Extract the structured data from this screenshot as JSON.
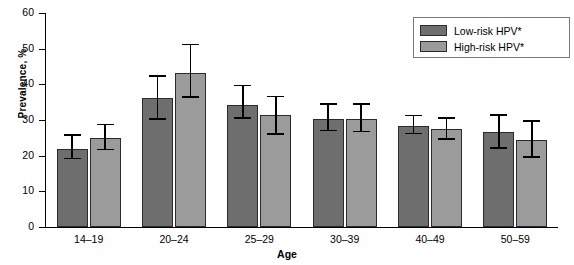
{
  "chart_data": {
    "type": "bar",
    "title": "",
    "xlabel": "Age",
    "ylabel": "Prevalence, %",
    "ylim": [
      0,
      60
    ],
    "yticks": [
      0,
      10,
      20,
      30,
      40,
      50,
      60
    ],
    "grid": false,
    "legend_position": "top-right",
    "categories": [
      "14–19",
      "20–24",
      "25–29",
      "30–39",
      "40–49",
      "50–59"
    ],
    "series": [
      {
        "name": "Low-risk HPV*",
        "color": "#6e6e6e",
        "values": [
          22.0,
          36.2,
          34.3,
          30.3,
          28.3,
          26.6
        ],
        "ci_low": [
          19.0,
          30.1,
          30.4,
          26.8,
          26.0,
          22.0
        ],
        "ci_high": [
          25.5,
          42.2,
          39.4,
          34.2,
          31.0,
          31.2
        ]
      },
      {
        "name": "High-risk HPV*",
        "color": "#9b9b9b",
        "values": [
          25.0,
          43.3,
          31.3,
          30.4,
          27.4,
          24.5
        ],
        "ci_low": [
          21.5,
          36.3,
          25.9,
          26.5,
          24.4,
          19.4
        ],
        "ci_high": [
          28.5,
          51.0,
          36.4,
          34.3,
          30.4,
          29.5
        ]
      }
    ]
  },
  "legend": {
    "items": [
      {
        "label": "Low-risk HPV*",
        "color": "#6e6e6e"
      },
      {
        "label": "High-risk HPV*",
        "color": "#9b9b9b"
      }
    ]
  },
  "axis": {
    "y_title": "Prevalence, %",
    "x_title": "Age",
    "y_tick_labels": [
      "60",
      "50",
      "40",
      "30",
      "20",
      "10",
      "0"
    ],
    "x_tick_labels": [
      "14–19",
      "20–24",
      "25–29",
      "30–39",
      "40–49",
      "50–59"
    ]
  }
}
